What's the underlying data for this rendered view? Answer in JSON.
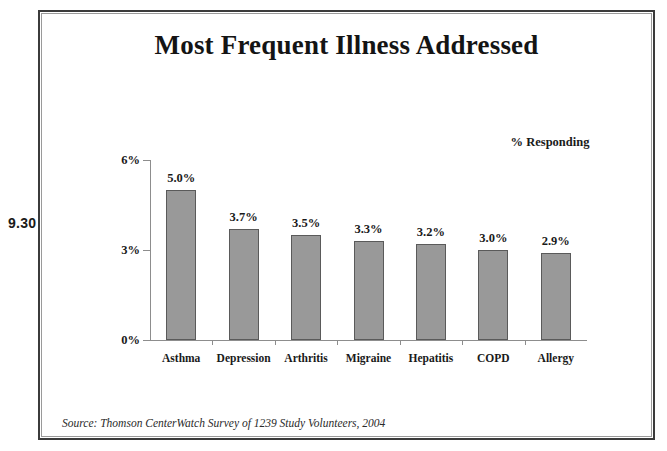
{
  "figure": {
    "number": "9.30"
  },
  "chart": {
    "title": "Most Frequent Illness Addressed",
    "legend_note": "% Responding",
    "source": "Source: Thomson CenterWatch Survey of 1239 Study Volunteers, 2004"
  },
  "chart_data": {
    "type": "bar",
    "title": "Most Frequent Illness Addressed",
    "subtitle": "",
    "xlabel": "",
    "ylabel": "% Responding",
    "categories": [
      "Asthma",
      "Depression",
      "Arthritis",
      "Migraine",
      "Hepatitis",
      "COPD",
      "Allergy"
    ],
    "values": [
      5.0,
      3.7,
      3.5,
      3.3,
      3.2,
      3.0,
      2.9
    ],
    "value_labels": [
      "5.0%",
      "3.7%",
      "3.5%",
      "3.3%",
      "3.2%",
      "3.0%",
      "2.9%"
    ],
    "ylim": [
      0,
      6
    ],
    "yticks": [
      0,
      3,
      6
    ],
    "ytick_labels": [
      "0%",
      "3%",
      "6%"
    ],
    "grid": false,
    "legend": "none",
    "bar_color": "#999999",
    "bar_edge_color": "#5a5a5a",
    "axis_color": "#8d8d8d",
    "text_color": "#1a1a1a",
    "annotations": [
      "% Responding",
      "Source: Thomson CenterWatch Survey of 1239 Study Volunteers, 2004"
    ]
  }
}
